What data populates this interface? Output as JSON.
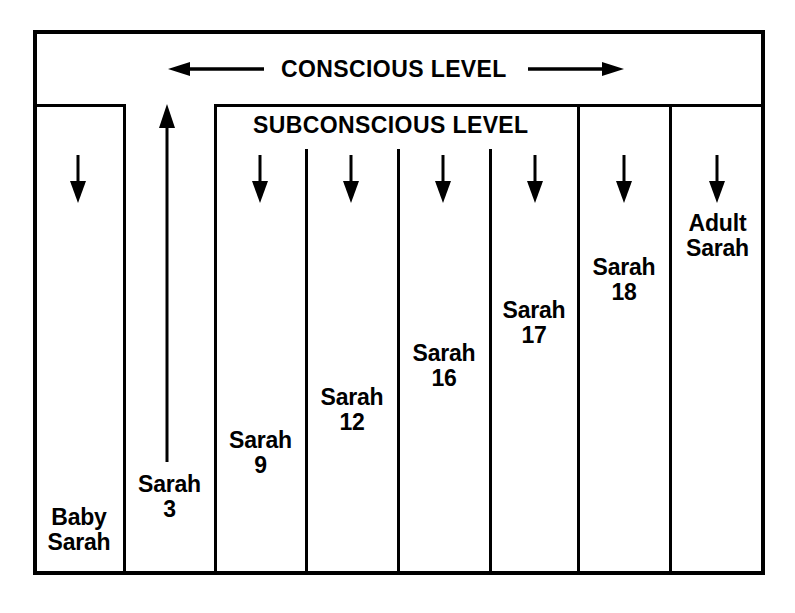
{
  "diagram": {
    "title_band": {
      "label": "CONSCIOUS LEVEL",
      "left_arrow_name": "arrow-left",
      "right_arrow_name": "arrow-right"
    },
    "subconscious_band": {
      "label": "SUBCONSCIOUS LEVEL"
    },
    "columns": [
      {
        "id": "baby-sarah",
        "label": "Baby\nSarah",
        "arrow": "down"
      },
      {
        "id": "sarah-3",
        "label": "Sarah\n3",
        "arrow": "up"
      },
      {
        "id": "sarah-9",
        "label": "Sarah\n9",
        "arrow": "down"
      },
      {
        "id": "sarah-12",
        "label": "Sarah\n12",
        "arrow": "down"
      },
      {
        "id": "sarah-16",
        "label": "Sarah\n16",
        "arrow": "down"
      },
      {
        "id": "sarah-17",
        "label": "Sarah\n17",
        "arrow": "down"
      },
      {
        "id": "sarah-18",
        "label": "Sarah\n18",
        "arrow": "down"
      },
      {
        "id": "adult-sarah",
        "label": "Adult\nSarah",
        "arrow": "down"
      }
    ],
    "colors": {
      "ink": "#000000",
      "paper": "#ffffff"
    }
  }
}
